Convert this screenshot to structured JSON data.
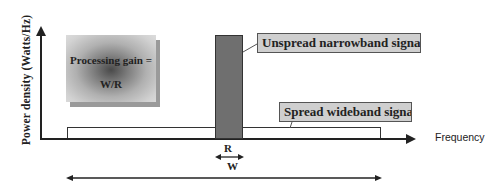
{
  "diagram": {
    "y_axis_label": "Power density (Watts/Hz)",
    "x_axis_label": "Frequency",
    "processing_gain": {
      "line1": "Processing gain =",
      "line2": "W/R"
    },
    "callouts": {
      "narrowband": "Unspread narrowband signal",
      "wideband": "Spread wideband signal"
    },
    "dimensions": {
      "narrow_width_label": "R",
      "wide_width_label": "W"
    },
    "colors": {
      "axis": "#222222",
      "narrowband_fill": "#6f6f6f",
      "callout_fill": "#cfcfcf",
      "wideband_fill": "#ffffff"
    }
  }
}
